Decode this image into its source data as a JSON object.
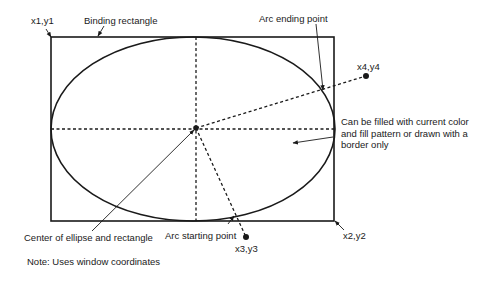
{
  "diagram": {
    "labels": {
      "corner_top_left": "x1,y1",
      "binding_rectangle": "Binding rectangle",
      "arc_ending_point": "Arc ending point",
      "end_point": "x4,y4",
      "fill_note": "Can be filled with current color and fill pattern or drawn with a border only",
      "center": "Center of ellipse and rectangle",
      "arc_starting_point": "Arc starting point",
      "start_point": "x3,y3",
      "corner_bottom_right": "x2,y2",
      "note": "Note: Uses window coordinates"
    },
    "colors": {
      "stroke": "#1a1a1a",
      "background": "#ffffff"
    }
  }
}
